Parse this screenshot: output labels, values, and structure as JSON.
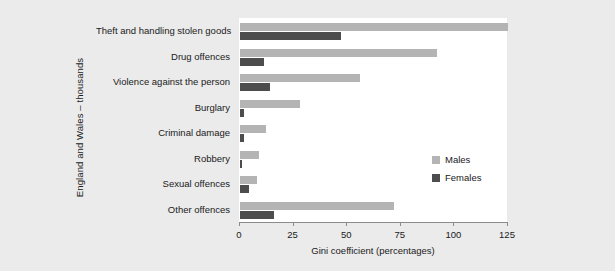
{
  "chart_data": {
    "type": "bar",
    "orientation": "horizontal",
    "title": "",
    "xlabel": "Gini coefficient (percentages)",
    "ylabel": "England and Wales – thousands",
    "xlim": [
      0,
      125
    ],
    "xticks": [
      0,
      25,
      50,
      75,
      100,
      125
    ],
    "xticklabels": [
      "0",
      "25",
      "50",
      "75",
      "100",
      "125"
    ],
    "grid": false,
    "legend_position": "center-right",
    "categories": [
      "Theft and handling stolen goods",
      "Drug offences",
      "Violence against the person",
      "Burglary",
      "Criminal damage",
      "Robbery",
      "Sexual offences",
      "Other offences"
    ],
    "series": [
      {
        "name": "Males",
        "color": "#b4b4b4",
        "values": [
          125,
          92,
          56,
          28,
          12,
          9,
          8,
          72
        ]
      },
      {
        "name": "Females",
        "color": "#4d4d4d",
        "values": [
          47,
          11,
          14,
          2,
          2,
          1,
          4,
          16
        ]
      }
    ]
  },
  "colors": {
    "background": "#ebebeb",
    "plot_background": "#ffffff",
    "males": "#b4b4b4",
    "females": "#4d4d4d",
    "axis": "#8c8c8c",
    "text": "#1a1a1a"
  }
}
